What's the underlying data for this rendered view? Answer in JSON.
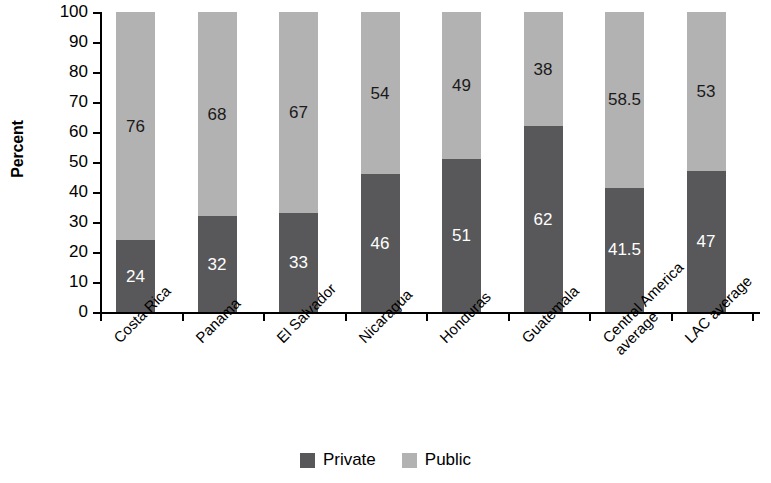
{
  "chart_data": {
    "type": "bar",
    "subtype": "stacked-bar-100",
    "title": "",
    "xlabel": "",
    "ylabel": "Percent",
    "ylim": [
      0,
      100
    ],
    "yticks": [
      0,
      10,
      20,
      30,
      40,
      50,
      60,
      70,
      80,
      90,
      100
    ],
    "ytick_labels": [
      "0",
      "10",
      "20",
      "30",
      "40",
      "50",
      "60",
      "70",
      "80",
      "90",
      "100"
    ],
    "grid": false,
    "legend_position": "bottom-center",
    "categories": [
      "Costa Rica",
      "Panama",
      "El Salvador",
      "Nicaragua",
      "Honduras",
      "Guatemala",
      "Central America\naverage",
      "LAC average"
    ],
    "category_labels_display": [
      "Costa Rica",
      "Panama",
      "El Salvador",
      "Nicaragua",
      "Honduras",
      "Guatemala",
      "Central America average",
      "LAC average"
    ],
    "series": [
      {
        "name": "Private",
        "color": "#58585a",
        "values": [
          24,
          32,
          33,
          46,
          51,
          62,
          41.5,
          47
        ],
        "value_labels": [
          "24",
          "32",
          "33",
          "46",
          "51",
          "62",
          "41.5",
          "47"
        ]
      },
      {
        "name": "Public",
        "color": "#b2b2b2",
        "values": [
          76,
          68,
          67,
          54,
          49,
          38,
          58.5,
          53
        ],
        "value_labels": [
          "76",
          "68",
          "67",
          "54",
          "49",
          "38",
          "58.5",
          "53"
        ]
      }
    ]
  },
  "legend": {
    "items": [
      {
        "label": "Private",
        "color": "#58585a"
      },
      {
        "label": "Public",
        "color": "#b2b2b2"
      }
    ]
  },
  "colors": {
    "private": "#58585a",
    "public": "#b2b2b2",
    "axis": "#000000",
    "background": "#ffffff"
  }
}
